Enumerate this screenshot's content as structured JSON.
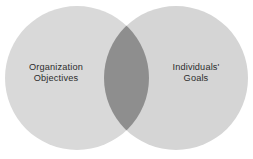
{
  "diagram": {
    "type": "venn",
    "title": "",
    "background_color": "#ffffff",
    "sets": [
      {
        "id": "organization",
        "label_line1": "Organization",
        "label_line2": "Objectives",
        "fill_color": "#d9d9d9",
        "center_x": 77,
        "center_y": 78,
        "radius": 72
      },
      {
        "id": "individuals",
        "label_line1": "Individuals'",
        "label_line2": "Goals",
        "fill_color": "#d5d5d5",
        "center_x": 176,
        "center_y": 78,
        "radius": 72
      }
    ],
    "intersection": {
      "id": "shared-area",
      "label": "",
      "fill_color": "#8e8e8e"
    },
    "text_color": "#2d2d2d"
  }
}
